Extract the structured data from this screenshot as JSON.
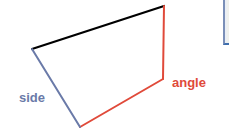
{
  "diagram": {
    "type": "quadrilateral",
    "vertices": {
      "top_left": [
        32,
        49
      ],
      "top_right": [
        164,
        6
      ],
      "right_mid": [
        163,
        79
      ],
      "bottom": [
        80,
        127
      ]
    },
    "edges": [
      {
        "name": "top-edge",
        "from": "top_left",
        "to": "top_right",
        "color": "#000000"
      },
      {
        "name": "right-edge",
        "from": "top_right",
        "to": "right_mid",
        "color": "#e04a3a"
      },
      {
        "name": "bottom-edge",
        "from": "right_mid",
        "to": "bottom",
        "color": "#e04a3a"
      },
      {
        "name": "left-edge",
        "from": "bottom",
        "to": "top_left",
        "color": "#6a7aa8"
      }
    ],
    "labels": {
      "side": {
        "text": "side",
        "color": "#6a7aa8"
      },
      "angle": {
        "text": "angle",
        "color": "#e04a3a"
      }
    }
  },
  "colors": {
    "background": "#ffffff",
    "black_edge": "#000000",
    "red_edge": "#e04a3a",
    "blue_edge": "#6a7aa8",
    "corner_panel_border": "#7a8fb8"
  }
}
